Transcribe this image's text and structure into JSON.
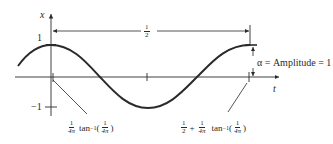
{
  "diagram": {
    "type": "cosine waveform with phase offset",
    "axes": {
      "y_label": "x",
      "x_label": "t",
      "y_ticks": [
        "1",
        "−1"
      ]
    },
    "period_dimension": {
      "num": "1",
      "den": "2"
    },
    "amplitude_annotation": "α = Amplitude = 1",
    "left_offset_label": {
      "frac_num": "1",
      "frac_den": "4π",
      "func": "tan",
      "exp": "−1",
      "arg_num": "1",
      "arg_den": "4π"
    },
    "right_offset_label": {
      "lead_num": "1",
      "lead_den": "2",
      "plus": "+",
      "frac_num": "1",
      "frac_den": "4π",
      "func": "tan",
      "exp": "−1",
      "arg_num": "1",
      "arg_den": "4π"
    },
    "colors": {
      "ink": "#2a2a2a",
      "background": "#ffffff"
    }
  }
}
